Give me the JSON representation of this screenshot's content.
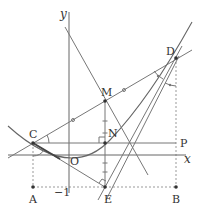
{
  "figure": {
    "type": "coordinate-geometry-diagram",
    "axes": {
      "x_label": "x",
      "y_label": "y",
      "origin_label": "O",
      "tick_label": "−1"
    },
    "points": {
      "A": "A",
      "B": "B",
      "C": "C",
      "D": "D",
      "E": "E",
      "M": "M",
      "N": "N",
      "P": "P"
    },
    "elements": [
      "parabola through C and D",
      "line CD through midpoint M (equal-length tick marks on CM and MD)",
      "perpendicular bisector of CD through M",
      "line DE",
      "segment CE (bold near C)",
      "horizontal line CP",
      "vertical segment ME on line through N, right angle at N and at E",
      "dotted line A–E–B at y = −1",
      "dotted verticals from C to A and from D to B",
      "angle arcs at C and at D"
    ]
  },
  "colors": {
    "line": "#777777",
    "bold": "#444444",
    "text": "#333333",
    "dotted": "#999999"
  }
}
